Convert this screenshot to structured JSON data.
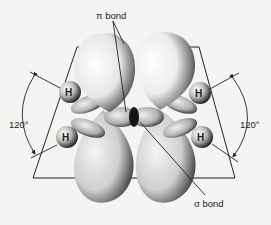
{
  "figure": {
    "labels": {
      "pi_bond": "π bond",
      "sigma_bond": "σ bond",
      "angle_left": "120°",
      "angle_right": "120°"
    },
    "atoms": [
      {
        "symbol": "H",
        "position": "upper-left"
      },
      {
        "symbol": "H",
        "position": "lower-left"
      },
      {
        "symbol": "H",
        "position": "upper-right"
      },
      {
        "symbol": "H",
        "position": "lower-right"
      }
    ],
    "colors": {
      "background": "#f4f4f2",
      "line": "#222222",
      "lobe_light": "#fafafa",
      "lobe_dark": "#1a1a1a"
    }
  }
}
